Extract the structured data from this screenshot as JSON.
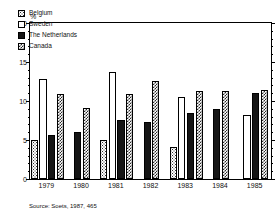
{
  "chart_data": {
    "type": "bar",
    "title": "",
    "subtitle": "",
    "xlabel": "",
    "ylabel": "%",
    "unit_label": "%",
    "categories": [
      "1979",
      "1980",
      "1981",
      "1982",
      "1983",
      "1984",
      "1985"
    ],
    "series": [
      {
        "name": "Belgium",
        "pattern": "dotted",
        "values": [
          4.9,
          null,
          4.9,
          null,
          4.1,
          null,
          null
        ]
      },
      {
        "name": "Sweden",
        "pattern": "white",
        "values": [
          12.7,
          null,
          13.5,
          null,
          10.4,
          null,
          8.1
        ]
      },
      {
        "name": "The Netherlands",
        "pattern": "solid",
        "values": [
          5.6,
          5.9,
          7.5,
          7.2,
          8.4,
          8.8,
          10.9
        ]
      },
      {
        "name": "Canada",
        "pattern": "checkered",
        "values": [
          10.7,
          9.0,
          10.7,
          12.4,
          11.2,
          11.2,
          11.3
        ]
      }
    ],
    "ylim": [
      0,
      20
    ],
    "yticks": [
      0,
      5,
      10,
      15,
      20
    ],
    "ytick_labels": [
      "0",
      "5",
      "10",
      "15",
      "20"
    ],
    "minor_tick_step": 1,
    "grid": false,
    "legend_position": "top-left",
    "source_note": "Source: Soets, 1987, 465",
    "colors": {
      "axis": "#000000",
      "text": "#111111",
      "background": "#ffffff",
      "netherlands_fill": "#151515",
      "canada_fill": "#2a2a2a",
      "belgium_fill": "#333333"
    }
  }
}
